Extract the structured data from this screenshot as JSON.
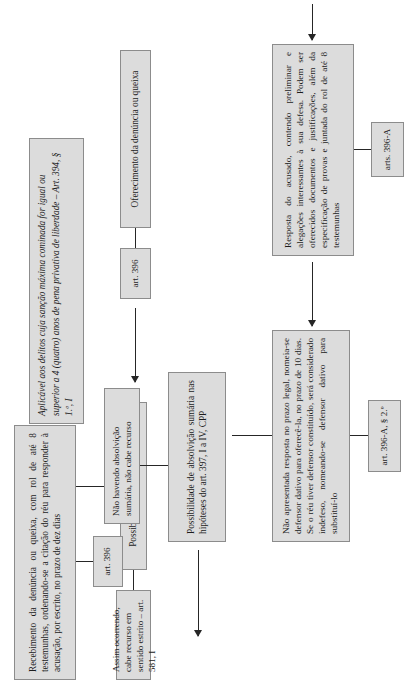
{
  "document": {
    "title": "Fluxograma do procedimento comum ordinário"
  },
  "nodes": {
    "scope_note": {
      "id": "scope-note",
      "text": "Aplicável aos delitos cuja sanção máxima cominada for igual ou superior a 4 (quatro) anos de pena privativa de liberdade – Art. 394, § 1.º, I"
    },
    "step1": {
      "id": "oferecimento",
      "text": "Oferecimento da denúncia ou queixa",
      "tag": "art. 396"
    },
    "step2": {
      "id": "rejeicao-liminar",
      "text": "Possibilidade de rejeição liminar",
      "tag": "Assim ocorrendo, cabe recurso em sentido estrito – art. 581, I"
    },
    "step3": {
      "id": "recebimento",
      "text": "Recebimento da denúncia ou queixa, com rol de até 8 testemunhas, ordenando-se a citação do réu para responder à acusação, por escrito, no prazo de dez dias",
      "tag": "art. 396"
    },
    "step4": {
      "id": "resposta-acusado",
      "text": "Resposta do acusado, contendo preliminar e alegações interes­santes à sua defesa. Podem ser oferecidos documentos e justifi­cações, além da especificação de provas e juntada do rol de até 8 testemunhas",
      "tag": "arts. 396-A"
    },
    "step5": {
      "id": "resposta-nao-apresentada",
      "text": "Não apresentada resposta no prazo legal, nomeia-se defensor dativo para oferecê-la, no prazo de 10 dias. Se o réu tiver defensor constituído, será considerado indefeso, nomeando-se defensor dativo para substituí-lo",
      "tag": "art. 396-A, § 2.º"
    },
    "step6": {
      "id": "absolvicao-sumaria",
      "text": "Possibilidade de absolvição sumária nas hipóteses do art. 397, I a IV, CPP",
      "tag": "Não havendo absolvição su­mária, não cabe recurso"
    }
  },
  "colors": {
    "node_fill": "#dcdcdc",
    "node_border": "#8c8c8c",
    "connector": "#262626",
    "page_background": "#ffffff",
    "text": "#1c1c1c"
  }
}
